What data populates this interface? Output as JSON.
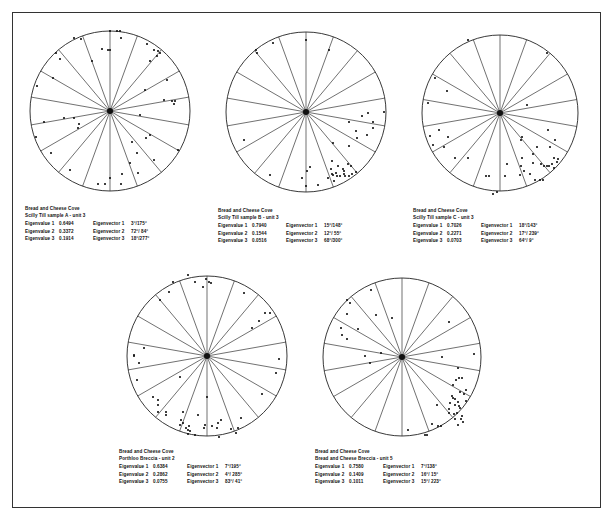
{
  "figure": {
    "plots": [
      {
        "id": "A",
        "title_line1": "Bread and Cheese Cove",
        "title_line2": "Scilly Till sample A - unit 3",
        "eigenvalues": [
          {
            "label": "Eigenvalue 1",
            "value": "0.6494"
          },
          {
            "label": "Eigenvalue 2",
            "value": "0.3372"
          },
          {
            "label": "Eigenvalue 3",
            "value": "0.1914"
          }
        ],
        "eigenvectors": [
          {
            "label": "Eigenvector 1",
            "value": "3°/175°"
          },
          {
            "label": "Eigenvector 2",
            "value": "72°/ 84°"
          },
          {
            "label": "Eigenvector 3",
            "value": "18°/277°"
          }
        ]
      },
      {
        "id": "B",
        "title_line1": "Bread and Cheese Cove",
        "title_line2": "Scilly Till sample B - unit 3",
        "eigenvalues": [
          {
            "label": "Eigenvalue 1",
            "value": "0.7940"
          },
          {
            "label": "Eigenvalue 2",
            "value": "0.1544"
          },
          {
            "label": "Eigenvalue 3",
            "value": "0.0516"
          }
        ],
        "eigenvectors": [
          {
            "label": "Eigenvector 1",
            "value": "15°/148°"
          },
          {
            "label": "Eigenvector 2",
            "value": "12°/ 55°"
          },
          {
            "label": "Eigenvector 3",
            "value": "68°/300°"
          }
        ]
      },
      {
        "id": "C",
        "title_line1": "Bread and Cheese Cove",
        "title_line2": "Scilly Till sample C - unit 3",
        "eigenvalues": [
          {
            "label": "Eigenvalue 1",
            "value": "0.7026"
          },
          {
            "label": "Eigenvalue 2",
            "value": "0.2271"
          },
          {
            "label": "Eigenvalue 3",
            "value": "0.0703"
          }
        ],
        "eigenvectors": [
          {
            "label": "Eigenvector 1",
            "value": "18°/143°"
          },
          {
            "label": "Eigenvector 2",
            "value": "17°/ 239°"
          },
          {
            "label": "Eigenvector 3",
            "value": "64°/ 9°"
          }
        ]
      },
      {
        "id": "D",
        "title_line1": "Bread and Cheese Cove",
        "title_line2": "Porthloo Breccia - unit 2",
        "eigenvalues": [
          {
            "label": "Eigenvalue 1",
            "value": "0.6384"
          },
          {
            "label": "Eigenvalue 2",
            "value": "0.2862"
          },
          {
            "label": "Eigenvalue 3",
            "value": "0.0755"
          }
        ],
        "eigenvectors": [
          {
            "label": "Eigenvector 1",
            "value": "7°/195°"
          },
          {
            "label": "Eigenvector 2",
            "value": "4°/ 285°"
          },
          {
            "label": "Eigenvector 3",
            "value": "83°/ 41°"
          }
        ]
      },
      {
        "id": "E",
        "title_line1": "Bread and Cheese Cove",
        "title_line2": "Bread and Cheese Breccia - unit 5",
        "eigenvalues": [
          {
            "label": "Eigenvalue 1",
            "value": "0.7580"
          },
          {
            "label": "Eigenvalue 2",
            "value": "0.1409"
          },
          {
            "label": "Eigenvalue 3",
            "value": "0.1011"
          }
        ],
        "eigenvectors": [
          {
            "label": "Eigenvector 1",
            "value": "7°/138°"
          },
          {
            "label": "Eigenvector 2",
            "value": "16°/ 15°"
          },
          {
            "label": "Eigenvector 3",
            "value": "15°/ 223°"
          }
        ]
      }
    ]
  },
  "chart_data": [
    {
      "type": "scatter",
      "title": "Bread and Cheese Cove — Scilly Till sample A - unit 3",
      "projection": "polar stereonet, 18 radial sectors at 20° intervals",
      "center": [
        110,
        111
      ],
      "radius": 80,
      "points_xy_px": [
        [
          110,
          31
        ],
        [
          117,
          31
        ],
        [
          120,
          31
        ],
        [
          121,
          38
        ],
        [
          74,
          38
        ],
        [
          81,
          39
        ],
        [
          102,
          49
        ],
        [
          108,
          50
        ],
        [
          110,
          50
        ],
        [
          147,
          44
        ],
        [
          154,
          50
        ],
        [
          158,
          51
        ],
        [
          160,
          53
        ],
        [
          157,
          56
        ],
        [
          150,
          61
        ],
        [
          56,
          53
        ],
        [
          60,
          59
        ],
        [
          92,
          61
        ],
        [
          53,
          78
        ],
        [
          167,
          80
        ],
        [
          145,
          90
        ],
        [
          37,
          86
        ],
        [
          164,
          100
        ],
        [
          172,
          101
        ],
        [
          175,
          101
        ],
        [
          174,
          104
        ],
        [
          140,
          115
        ],
        [
          44,
          122
        ],
        [
          64,
          118
        ],
        [
          74,
          118
        ],
        [
          79,
          124
        ],
        [
          78,
          128
        ],
        [
          36,
          137
        ],
        [
          150,
          135
        ],
        [
          146,
          138
        ],
        [
          132,
          142
        ],
        [
          178,
          150
        ],
        [
          51,
          153
        ],
        [
          137,
          153
        ],
        [
          130,
          163
        ],
        [
          154,
          160
        ],
        [
          70,
          170
        ],
        [
          138,
          173
        ],
        [
          122,
          174
        ],
        [
          110,
          178
        ],
        [
          98,
          184
        ],
        [
          105,
          184
        ],
        [
          121,
          184
        ]
      ],
      "eigenvalues": [
        0.6494,
        0.3372,
        0.1914
      ],
      "eigenvectors": [
        "3°/175°",
        "72°/84°",
        "18°/277°"
      ]
    },
    {
      "type": "scatter",
      "title": "Bread and Cheese Cove — Scilly Till sample B - unit 3",
      "projection": "polar stereonet, 18 radial sectors at 20° intervals",
      "center": [
        306,
        112
      ],
      "radius": 80,
      "points_xy_px": [
        [
          306,
          40
        ],
        [
          273,
          43
        ],
        [
          256,
          50
        ],
        [
          257,
          53
        ],
        [
          329,
          50
        ],
        [
          384,
          112
        ],
        [
          368,
          113
        ],
        [
          362,
          116
        ],
        [
          373,
          122
        ],
        [
          349,
          122
        ],
        [
          373,
          128
        ],
        [
          356,
          131
        ],
        [
          357,
          138
        ],
        [
          367,
          135
        ],
        [
          333,
          143
        ],
        [
          349,
          146
        ],
        [
          244,
          140
        ],
        [
          270,
          175
        ],
        [
          310,
          167
        ],
        [
          307,
          171
        ],
        [
          302,
          178
        ],
        [
          306,
          186
        ],
        [
          318,
          185
        ],
        [
          332,
          161
        ],
        [
          338,
          166
        ],
        [
          343,
          169
        ],
        [
          332,
          174
        ],
        [
          337,
          176
        ],
        [
          340,
          176
        ],
        [
          344,
          174
        ],
        [
          345,
          176
        ],
        [
          349,
          176
        ],
        [
          352,
          174
        ],
        [
          356,
          172
        ],
        [
          348,
          164
        ],
        [
          351,
          166
        ],
        [
          328,
          178
        ],
        [
          334,
          181
        ],
        [
          344,
          171
        ],
        [
          336,
          173
        ],
        [
          331,
          169
        ],
        [
          333,
          175
        ]
      ],
      "eigenvalues": [
        0.794,
        0.1544,
        0.0516
      ],
      "eigenvectors": [
        "15°/148°",
        "12°/55°",
        "68°/300°"
      ]
    },
    {
      "type": "scatter",
      "title": "Bread and Cheese Cove — Scilly Till sample C - unit 3",
      "projection": "polar stereonet, 18 radial sectors at 20° intervals",
      "center": [
        500,
        113
      ],
      "radius": 78,
      "points_xy_px": [
        [
          468,
          40
        ],
        [
          547,
          53
        ],
        [
          435,
          78
        ],
        [
          447,
          91
        ],
        [
          428,
          103
        ],
        [
          527,
          105
        ],
        [
          439,
          130
        ],
        [
          448,
          137
        ],
        [
          430,
          136
        ],
        [
          433,
          145
        ],
        [
          444,
          147
        ],
        [
          455,
          158
        ],
        [
          468,
          158
        ],
        [
          548,
          130
        ],
        [
          555,
          140
        ],
        [
          537,
          147
        ],
        [
          550,
          147
        ],
        [
          522,
          137
        ],
        [
          521,
          140
        ],
        [
          533,
          154
        ],
        [
          554,
          158
        ],
        [
          557,
          162
        ],
        [
          558,
          159
        ],
        [
          541,
          164
        ],
        [
          544,
          166
        ],
        [
          547,
          166
        ],
        [
          549,
          166
        ],
        [
          552,
          164
        ],
        [
          554,
          168
        ],
        [
          533,
          163
        ],
        [
          522,
          158
        ],
        [
          521,
          166
        ],
        [
          524,
          171
        ],
        [
          520,
          175
        ],
        [
          530,
          174
        ],
        [
          540,
          180
        ],
        [
          535,
          180
        ],
        [
          543,
          180
        ],
        [
          507,
          164
        ],
        [
          486,
          176
        ],
        [
          489,
          176
        ],
        [
          505,
          176
        ],
        [
          493,
          194
        ],
        [
          497,
          192
        ]
      ],
      "eigenvalues": [
        0.7026,
        0.2271,
        0.0703
      ],
      "eigenvectors": [
        "18°/143°",
        "17°/239°",
        "64°/9°"
      ]
    },
    {
      "type": "scatter",
      "title": "Bread and Cheese Cove — Porthloo Breccia - unit 2",
      "projection": "polar stereonet, 18 radial sectors at 20° intervals",
      "center": [
        207,
        356
      ],
      "radius": 80,
      "points_xy_px": [
        [
          188,
          275
        ],
        [
          173,
          282
        ],
        [
          195,
          282
        ],
        [
          206,
          279
        ],
        [
          209,
          282
        ],
        [
          211,
          283
        ],
        [
          203,
          287
        ],
        [
          169,
          292
        ],
        [
          160,
          300
        ],
        [
          244,
          293
        ],
        [
          265,
          313
        ],
        [
          270,
          313
        ],
        [
          259,
          321
        ],
        [
          252,
          328
        ],
        [
          144,
          348
        ],
        [
          134,
          355
        ],
        [
          134,
          356
        ],
        [
          139,
          363
        ],
        [
          279,
          359
        ],
        [
          276,
          373
        ],
        [
          137,
          380
        ],
        [
          180,
          377
        ],
        [
          262,
          394
        ],
        [
          153,
          397
        ],
        [
          158,
          400
        ],
        [
          158,
          405
        ],
        [
          158,
          412
        ],
        [
          166,
          412
        ],
        [
          166,
          415
        ],
        [
          183,
          412
        ],
        [
          181,
          420
        ],
        [
          180,
          425
        ],
        [
          183,
          423
        ],
        [
          186,
          428
        ],
        [
          188,
          430
        ],
        [
          189,
          426
        ],
        [
          188,
          434
        ],
        [
          190,
          431
        ],
        [
          198,
          415
        ],
        [
          207,
          397
        ],
        [
          205,
          425
        ],
        [
          204,
          428
        ],
        [
          217,
          428
        ],
        [
          219,
          437
        ],
        [
          212,
          426
        ],
        [
          218,
          423
        ],
        [
          221,
          420
        ],
        [
          241,
          418
        ],
        [
          238,
          428
        ],
        [
          236,
          433
        ],
        [
          231,
          429
        ],
        [
          195,
          435
        ]
      ],
      "eigenvalues": [
        0.6384,
        0.2862,
        0.0755
      ],
      "eigenvectors": [
        "7°/195°",
        "4°/285°",
        "83°/41°"
      ]
    },
    {
      "type": "scatter",
      "title": "Bread and Cheese Cove — Bread and Cheese Breccia - unit 5",
      "projection": "polar stereonet, 18 radial sectors at 20° intervals",
      "center": [
        402,
        357
      ],
      "radius": 79,
      "points_xy_px": [
        [
          371,
          290
        ],
        [
          347,
          300
        ],
        [
          350,
          303
        ],
        [
          347,
          314
        ],
        [
          376,
          315
        ],
        [
          392,
          318
        ],
        [
          341,
          328
        ],
        [
          342,
          335
        ],
        [
          347,
          339
        ],
        [
          358,
          329
        ],
        [
          365,
          356
        ],
        [
          381,
          353
        ],
        [
          370,
          363
        ],
        [
          449,
          322
        ],
        [
          474,
          354
        ],
        [
          442,
          357
        ],
        [
          458,
          368
        ],
        [
          456,
          380
        ],
        [
          459,
          378
        ],
        [
          462,
          378
        ],
        [
          453,
          385
        ],
        [
          466,
          390
        ],
        [
          460,
          392
        ],
        [
          452,
          396
        ],
        [
          453,
          398
        ],
        [
          455,
          399
        ],
        [
          458,
          402
        ],
        [
          464,
          394
        ],
        [
          466,
          401
        ],
        [
          450,
          403
        ],
        [
          455,
          405
        ],
        [
          459,
          406
        ],
        [
          460,
          408
        ],
        [
          449,
          413
        ],
        [
          454,
          414
        ],
        [
          457,
          413
        ],
        [
          462,
          416
        ],
        [
          455,
          419
        ],
        [
          461,
          419
        ],
        [
          463,
          422
        ],
        [
          458,
          425
        ],
        [
          437,
          405
        ],
        [
          449,
          409
        ],
        [
          432,
          424
        ],
        [
          438,
          426
        ],
        [
          441,
          426
        ],
        [
          425,
          435
        ],
        [
          427,
          435
        ],
        [
          408,
          430
        ]
      ],
      "eigenvalues": [
        0.758,
        0.1409,
        0.1011
      ],
      "eigenvectors": [
        "7°/138°",
        "16°/15°",
        "15°/223°"
      ]
    }
  ]
}
